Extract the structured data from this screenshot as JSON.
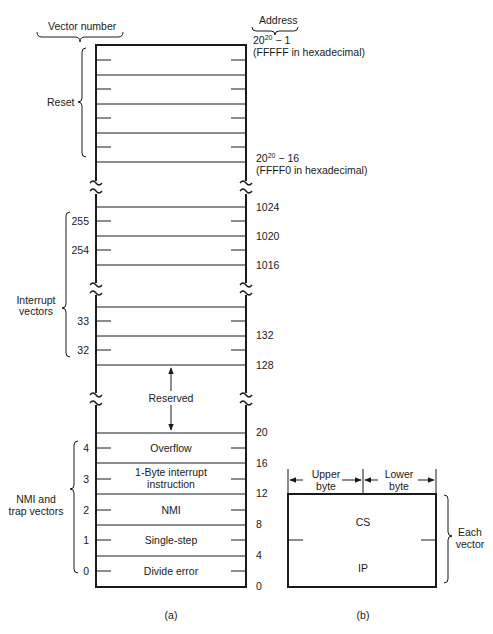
{
  "figure": {
    "part_a": {
      "caption": "(a)",
      "header_left": "Vector number",
      "header_right": "Address",
      "top_address": {
        "base": "20",
        "exp": "20",
        "rest": " − 1",
        "note": "(FFFFF in hexadecimal)"
      },
      "reset_address": {
        "base": "20",
        "exp": "20",
        "rest": " − 16",
        "note": "(FFFF0 in hexadecimal)"
      },
      "group_labels": {
        "reset": "Reset",
        "interrupt_line1": "Interrupt",
        "interrupt_line2": "vectors",
        "nmi_line1": "NMI and",
        "nmi_line2": "trap vectors"
      },
      "vector_numbers": [
        "255",
        "254",
        "33",
        "32",
        "4",
        "3",
        "2",
        "1",
        "0"
      ],
      "addresses": [
        "1024",
        "1020",
        "1016",
        "132",
        "128",
        "20",
        "16",
        "12",
        "8",
        "4",
        "0"
      ],
      "reserved_label": "Reserved",
      "rows": [
        {
          "vector": "4",
          "label": "Overflow"
        },
        {
          "vector": "3",
          "label_line1": "1-Byte interrupt",
          "label_line2": "instruction"
        },
        {
          "vector": "2",
          "label": "NMI"
        },
        {
          "vector": "1",
          "label": "Single-step"
        },
        {
          "vector": "0",
          "label": "Divide error"
        }
      ]
    },
    "part_b": {
      "caption": "(b)",
      "upper_byte_line1": "Upper",
      "upper_byte_line2": "byte",
      "lower_byte_line1": "Lower",
      "lower_byte_line2": "byte",
      "cs": "CS",
      "ip": "IP",
      "each_line1": "Each",
      "each_line2": "vector"
    }
  }
}
